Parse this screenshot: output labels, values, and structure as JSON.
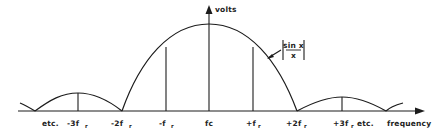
{
  "diagram": {
    "y_axis_label": "volts",
    "x_axis_label": "frequency",
    "curve_label": {
      "numerator": "sin x",
      "denominator": "x"
    },
    "ticks": [
      {
        "label": "etc.",
        "x": 94
      },
      {
        "label": "-3fr",
        "x": 78
      },
      {
        "label": "-2fr",
        "x": 122
      },
      {
        "label": "-fr",
        "x": 166
      },
      {
        "label": "fc",
        "x": 209
      },
      {
        "label": "+fr",
        "x": 253
      },
      {
        "label": "+2fr",
        "x": 297
      },
      {
        "label": "+3fr etc.",
        "x": 342
      }
    ],
    "colors": {
      "ink": "#1c1c1c",
      "background": "#ffffff"
    }
  },
  "labels": {
    "volts": "volts",
    "frequency": "frequency",
    "sin_num": "sin x",
    "sin_den": "x",
    "etc_left": "etc.",
    "m3fr": "-3f",
    "m2fr": "-2f",
    "m1fr": "-f",
    "fc": "fc",
    "p1fr": "+f",
    "p2fr": "+2f",
    "p3fr": "+3f",
    "sub": "r",
    "etc_right": "etc."
  }
}
